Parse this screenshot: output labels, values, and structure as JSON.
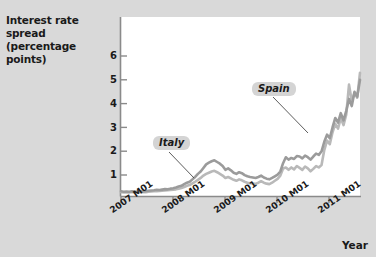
{
  "chart_data": {
    "type": "line",
    "title": "Interest rate spread (percentage points)",
    "title_lines": [
      "Interest rate spread",
      "(percentage points)"
    ],
    "ylabel": "Interest rate spread (percentage points)",
    "xlabel": "Year",
    "ylim": [
      0,
      6.5
    ],
    "yticks": [
      1,
      2,
      3,
      4,
      5,
      6
    ],
    "ytick_labels": [
      "1",
      "2",
      "3",
      "4",
      "5",
      "6"
    ],
    "grid": false,
    "legend_position": "inline-annotations",
    "xticks": [
      "2007 M01",
      "2008 M01",
      "2009 M01",
      "2010 M01",
      "2011 M01"
    ],
    "x_start": "2007 M01",
    "x_end": "2011 M10",
    "annotations": [
      {
        "text": "Italy",
        "series": "Italy"
      },
      {
        "text": "Spain",
        "series": "Spain"
      }
    ],
    "colors": {
      "italy_line": "#9a9a9a",
      "spain_line": "#b5b5b5",
      "plot_background": "#ffffff",
      "figure_background": "#d9d9d9",
      "text": "#1a1a1a",
      "label_box": "#d4d4d4"
    },
    "series": [
      {
        "name": "Italy",
        "values": [
          0.22,
          0.2,
          0.21,
          0.2,
          0.22,
          0.21,
          0.2,
          0.22,
          0.21,
          0.22,
          0.24,
          0.25,
          0.26,
          0.28,
          0.27,
          0.29,
          0.31,
          0.3,
          0.33,
          0.35,
          0.38,
          0.42,
          0.45,
          0.52,
          0.58,
          0.62,
          0.72,
          0.82,
          0.95,
          1.05,
          1.2,
          1.35,
          1.42,
          1.48,
          1.52,
          1.45,
          1.38,
          1.28,
          1.12,
          1.18,
          1.1,
          1.0,
          0.95,
          1.02,
          0.98,
          0.9,
          0.85,
          0.82,
          0.8,
          0.78,
          0.82,
          0.88,
          0.8,
          0.75,
          0.72,
          0.78,
          0.85,
          0.92,
          1.05,
          1.4,
          1.65,
          1.55,
          1.62,
          1.58,
          1.7,
          1.68,
          1.6,
          1.72,
          1.65,
          1.55,
          1.68,
          1.8,
          1.75,
          1.9,
          2.3,
          2.6,
          2.45,
          2.9,
          3.3,
          3.1,
          3.5,
          3.2,
          3.6,
          4.1,
          3.8,
          4.4,
          4.2,
          4.9
        ]
      },
      {
        "name": "Spain",
        "values": [
          0.18,
          0.17,
          0.18,
          0.17,
          0.19,
          0.18,
          0.17,
          0.18,
          0.19,
          0.18,
          0.2,
          0.21,
          0.22,
          0.22,
          0.23,
          0.24,
          0.25,
          0.26,
          0.27,
          0.29,
          0.3,
          0.33,
          0.36,
          0.4,
          0.45,
          0.48,
          0.55,
          0.62,
          0.7,
          0.78,
          0.88,
          0.95,
          1.0,
          1.05,
          1.08,
          1.02,
          0.95,
          0.88,
          0.78,
          0.82,
          0.76,
          0.7,
          0.66,
          0.72,
          0.68,
          0.62,
          0.58,
          0.56,
          0.55,
          0.53,
          0.58,
          0.64,
          0.58,
          0.54,
          0.52,
          0.58,
          0.66,
          0.74,
          0.88,
          1.18,
          1.22,
          1.12,
          1.22,
          1.14,
          1.28,
          1.2,
          1.12,
          1.26,
          1.18,
          1.06,
          1.16,
          1.28,
          1.22,
          1.32,
          1.95,
          2.35,
          2.2,
          2.7,
          3.05,
          2.85,
          3.3,
          3.0,
          3.45,
          4.7,
          4.0,
          4.35,
          4.15,
          5.2
        ]
      }
    ]
  }
}
